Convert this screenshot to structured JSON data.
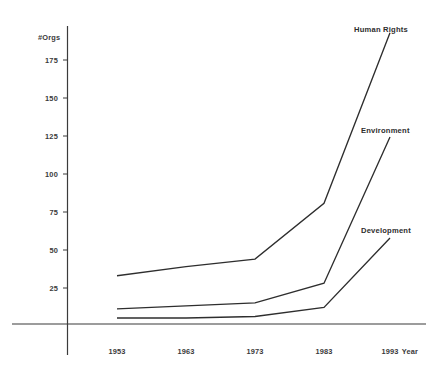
{
  "chart_data": {
    "type": "line",
    "title": "",
    "subtitle": "",
    "xlabel": "Year",
    "ylabel": "#Orgs",
    "x": [
      1953,
      1963,
      1973,
      1983,
      1993
    ],
    "xtick_labels": [
      "1953",
      "1963",
      "1973",
      "1983",
      "1993"
    ],
    "ytick_labels": [
      "25",
      "50",
      "75",
      "100",
      "125",
      "150",
      "175"
    ],
    "yticks": [
      25,
      50,
      75,
      100,
      125,
      150,
      175
    ],
    "xlim": [
      1950,
      1996
    ],
    "ylim": [
      0,
      200
    ],
    "grid": false,
    "legend_position": "inline-right-of-line-ends",
    "series": [
      {
        "name": "Human Rights",
        "values": [
          32,
          38,
          43,
          80,
          193
        ],
        "color": "#2e2e2e"
      },
      {
        "name": "Environment",
        "values": [
          10,
          12,
          14,
          27,
          124
        ],
        "color": "#2e2e2e"
      },
      {
        "name": "Development",
        "values": [
          4,
          4,
          5,
          11,
          57
        ],
        "color": "#2e2e2e"
      }
    ]
  },
  "axes": {
    "y_axis_title": "#Orgs",
    "x_axis_title": "Year"
  },
  "colors": {
    "background": "#ffffff",
    "axis": "#3b3b3b",
    "line": "#2e2e2e",
    "text": "#3a3a3a"
  }
}
